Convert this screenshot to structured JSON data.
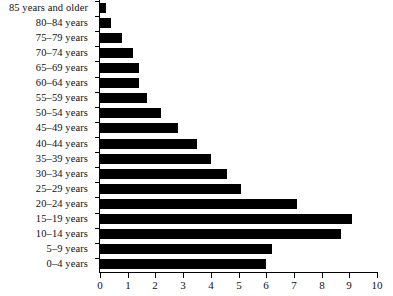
{
  "chart_data": {
    "type": "bar",
    "orientation": "horizontal",
    "title": "",
    "subtitle": "",
    "xlabel": "",
    "ylabel": "",
    "xlim": [
      0,
      10
    ],
    "grid": false,
    "legend": null,
    "legend_position": "none",
    "bar_color": "#000000",
    "background_color": "#ffffff",
    "axis_color": "#000000",
    "xticks": [
      0,
      1,
      2,
      3,
      4,
      5,
      6,
      7,
      8,
      9,
      10
    ],
    "xtick_labels": [
      "0",
      "1",
      "2",
      "3",
      "4",
      "5",
      "6",
      "7",
      "8",
      "9",
      "10"
    ],
    "categories": [
      "85 years and older",
      "80–84 years",
      "75–79 years",
      "70–74 years",
      "65–69 years",
      "60–64 years",
      "55–59 years",
      "50–54 years",
      "45–49 years",
      "40–44 years",
      "35–39 years",
      "30–34 years",
      "25–29 years",
      "20–24 years",
      "15–19 years",
      "10–14 years",
      "5–9 years",
      "0–4 years"
    ],
    "values": [
      0.2,
      0.4,
      0.8,
      1.2,
      1.4,
      1.4,
      1.7,
      2.2,
      2.8,
      3.5,
      4.0,
      4.6,
      5.1,
      7.1,
      9.1,
      8.7,
      6.2,
      6.0
    ]
  }
}
